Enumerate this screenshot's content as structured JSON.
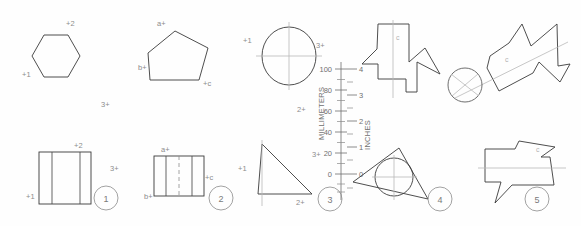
{
  "sheet": {
    "title": "Technical Drawing Practice Sheet",
    "background_color": "#fefefe",
    "line_color": "#3a3a3a",
    "label_color": "#8c8c8c"
  },
  "scale": {
    "metric_title": "MILLIMETERS",
    "imperial_title": "INCHES",
    "metric_ticks": [
      "100",
      "80",
      "60",
      "40",
      "20",
      "0"
    ],
    "imperial_ticks": [
      "4",
      "3",
      "2",
      "1",
      "0"
    ]
  },
  "top_row": {
    "hexagon": {
      "name": "hexagon",
      "labels": {
        "top": "+2",
        "left": "+1",
        "lower_right": "3+"
      }
    },
    "pentagon": {
      "name": "pentagon",
      "labels": {
        "top_left": "a+",
        "left": "b+",
        "bottom_right": "+c"
      }
    },
    "circle_crosshair": {
      "name": "circle-with-crosshairs",
      "labels": {
        "left": "+1",
        "right": "3+",
        "bottom": "2+"
      }
    },
    "arrow_polygon": {
      "name": "arrow-polygon",
      "labels": {
        "inner": "c"
      }
    },
    "star_polygon": {
      "name": "star-polygon",
      "labels": {
        "inner": "c"
      }
    }
  },
  "bottom_row": {
    "items": [
      {
        "marker": "1",
        "name": "square-with-vertical-lines",
        "labels": {
          "top": "+2",
          "left": "+1",
          "right": "3+"
        }
      },
      {
        "marker": "2",
        "name": "rectangle-with-center-line",
        "labels": {
          "top_left": "a+",
          "left": "b+",
          "right": "+c"
        }
      },
      {
        "marker": "3",
        "name": "triangle",
        "labels": {
          "left": "+1",
          "right": "3+",
          "bottom": "2+"
        }
      },
      {
        "marker": "4",
        "name": "triangle-with-inscribed-circle",
        "labels": {}
      },
      {
        "marker": "5",
        "name": "speech-balloon-polygon",
        "labels": {
          "inner": "c"
        }
      }
    ]
  }
}
